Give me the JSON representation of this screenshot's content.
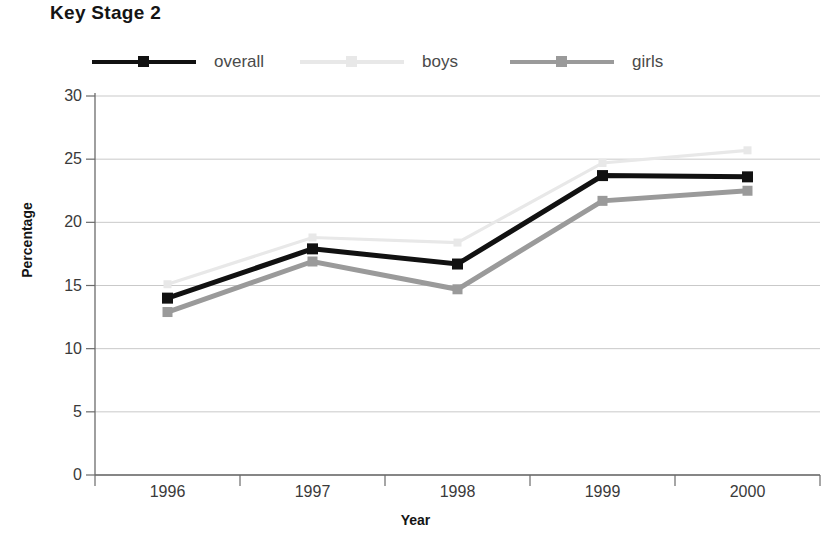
{
  "title": "Key Stage 2",
  "axes": {
    "ylabel": "Percentage",
    "xlabel": "Year"
  },
  "legend": [
    {
      "label": "overall",
      "color": "#111111",
      "marker": "square"
    },
    {
      "label": "boys",
      "color": "#e8e8e8",
      "marker": "square"
    },
    {
      "label": "girls",
      "color": "#9a9a9a",
      "marker": "square"
    }
  ],
  "y_ticks": [
    "30",
    "25",
    "20",
    "15",
    "10",
    "5",
    "0"
  ],
  "x_ticks": [
    "1996",
    "1997",
    "1998",
    "1999",
    "2000"
  ],
  "colors": {
    "overall": "#111111",
    "boys": "#e8e8e8",
    "girls": "#9a9a9a",
    "axis": "#6b6b6b",
    "grid": "#c9c9c9",
    "text": "#3a3a3a",
    "title": "#141414"
  },
  "chart_data": {
    "type": "line",
    "title": "Key Stage 2",
    "xlabel": "Year",
    "ylabel": "Percentage",
    "categories": [
      "1996",
      "1997",
      "1998",
      "1999",
      "2000"
    ],
    "x": [
      1996,
      1997,
      1998,
      1999,
      2000
    ],
    "ylim": [
      0,
      30
    ],
    "ytick_step": 5,
    "grid": "horizontal",
    "legend_position": "top",
    "series": [
      {
        "name": "overall",
        "color": "#111111",
        "values": [
          14.0,
          17.9,
          16.7,
          23.7,
          23.6
        ]
      },
      {
        "name": "boys",
        "color": "#e8e8e8",
        "values": [
          15.1,
          18.8,
          18.4,
          24.7,
          25.7
        ]
      },
      {
        "name": "girls",
        "color": "#9a9a9a",
        "values": [
          12.9,
          16.9,
          14.7,
          21.7,
          22.5
        ]
      }
    ]
  }
}
